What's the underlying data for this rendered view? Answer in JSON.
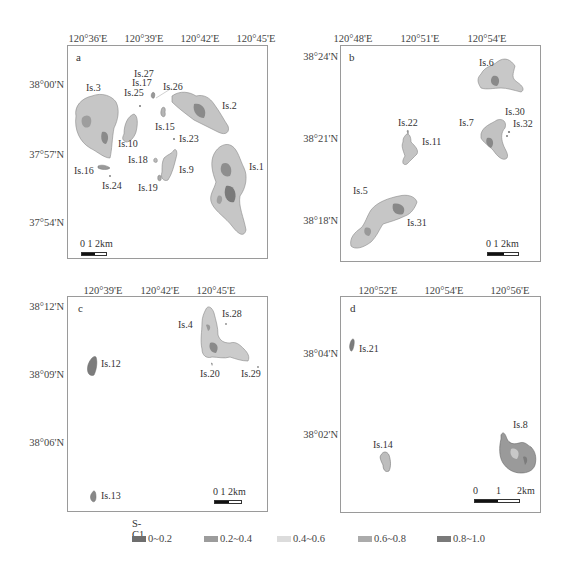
{
  "panels": {
    "a": {
      "letter": "a",
      "x_ticks": [
        "120°36'E",
        "120°39'E",
        "120°42'E",
        "120°45'E"
      ],
      "y_ticks": [
        "38°00'N",
        "37°57'N",
        "37°54'N"
      ],
      "islands": [
        "Is.1",
        "Is.2",
        "Is.3",
        "Is.9",
        "Is.10",
        "Is.15",
        "Is.16",
        "Is.17",
        "Is.18",
        "Is.19",
        "Is.23",
        "Is.24",
        "Is.25",
        "Is.26",
        "Is.27"
      ],
      "scale": "0  1  2km"
    },
    "b": {
      "letter": "b",
      "x_ticks": [
        "120°48'E",
        "120°51'E",
        "120°54'E"
      ],
      "y_ticks": [
        "38°24'N",
        "38°21'N",
        "38°18'N"
      ],
      "islands": [
        "Is.5",
        "Is.6",
        "Is.7",
        "Is.11",
        "Is.22",
        "Is.30",
        "Is.31",
        "Is.32"
      ],
      "scale": "0  1  2km"
    },
    "c": {
      "letter": "c",
      "x_ticks": [
        "120°39'E",
        "120°42'E",
        "120°45'E"
      ],
      "y_ticks": [
        "38°12'N",
        "38°09'N",
        "38°06'N"
      ],
      "islands": [
        "Is.4",
        "Is.12",
        "Is.13",
        "Is.20",
        "Is.28",
        "Is.29"
      ],
      "scale": "0  1  2km"
    },
    "d": {
      "letter": "d",
      "x_ticks": [
        "120°52'E",
        "120°54'E",
        "120°56'E"
      ],
      "y_ticks": [
        "38°04'N",
        "38°02'N"
      ],
      "islands": [
        "Is.8",
        "Is.14",
        "Is.21"
      ],
      "scale_0": "0",
      "scale_1": "1",
      "scale_2": "2km"
    }
  },
  "legend": {
    "title": "S-C1",
    "items": [
      {
        "label": "0~0.2",
        "color": "#6e6e6e"
      },
      {
        "label": "0.2~0.4",
        "color": "#9c9c9c"
      },
      {
        "label": "0.4~0.6",
        "color": "#dcdcdc"
      },
      {
        "label": "0.6~0.8",
        "color": "#ababab"
      },
      {
        "label": "0.8~1.0",
        "color": "#7a7a7a"
      }
    ]
  },
  "colors": {
    "land_light": "#c9c9c9",
    "land_mid": "#a6a6a6",
    "land_dark": "#7c7c7c",
    "frame": "#9a9a9a"
  }
}
